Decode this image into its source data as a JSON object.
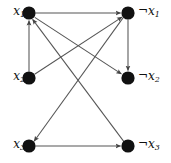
{
  "figure": {
    "type": "directed-graph",
    "background_color": "#ffffff",
    "node_color": "#111111",
    "edge_color": "#555555",
    "label_color": "#101010",
    "width": 171,
    "height": 163
  },
  "nodes": [
    {
      "id": "x1",
      "label_literal": "x",
      "label_index": "1",
      "negated": false,
      "label_text": "x1",
      "cx": 29,
      "cy": 13,
      "r": 6.5,
      "label_side": "left",
      "label_x": 2,
      "label_y": 5
    },
    {
      "id": "nx1",
      "label_literal": "x",
      "label_index": "1",
      "negated": true,
      "label_text": "¬x1",
      "cx": 128,
      "cy": 13,
      "r": 6.5,
      "label_side": "right",
      "label_x": 139,
      "label_y": 5
    },
    {
      "id": "x2",
      "label_literal": "x",
      "label_index": "2",
      "negated": false,
      "label_text": "x2",
      "cx": 29,
      "cy": 78,
      "r": 6.5,
      "label_side": "left",
      "label_x": 2,
      "label_y": 70
    },
    {
      "id": "nx2",
      "label_literal": "x",
      "label_index": "2",
      "negated": true,
      "label_text": "¬x2",
      "cx": 128,
      "cy": 78,
      "r": 6.5,
      "label_side": "right",
      "label_x": 139,
      "label_y": 70
    },
    {
      "id": "x3",
      "label_literal": "x",
      "label_index": "3",
      "negated": false,
      "label_text": "x3",
      "cx": 29,
      "cy": 146,
      "r": 6.5,
      "label_side": "left",
      "label_x": 2,
      "label_y": 138
    },
    {
      "id": "nx3",
      "label_literal": "x",
      "label_index": "3",
      "negated": true,
      "label_text": "¬x3",
      "cx": 128,
      "cy": 146,
      "r": 6.5,
      "label_side": "right",
      "label_x": 139,
      "label_y": 138
    }
  ],
  "edges": [
    {
      "id": "e1",
      "from": "x1",
      "to": "nx1",
      "kind": "horizontal"
    },
    {
      "id": "e2",
      "from": "x2",
      "to": "x1",
      "kind": "vertical"
    },
    {
      "id": "e3",
      "from": "nx1",
      "to": "nx2",
      "kind": "vertical"
    },
    {
      "id": "e4",
      "from": "x3",
      "to": "nx3",
      "kind": "horizontal"
    },
    {
      "id": "e5",
      "from": "x1",
      "to": "nx2",
      "kind": "diagonal"
    },
    {
      "id": "e6",
      "from": "x2",
      "to": "nx1",
      "kind": "diagonal"
    },
    {
      "id": "e7",
      "from": "nx1",
      "to": "x3",
      "kind": "diagonal"
    },
    {
      "id": "e8",
      "from": "nx3",
      "to": "x1",
      "kind": "diagonal"
    }
  ]
}
